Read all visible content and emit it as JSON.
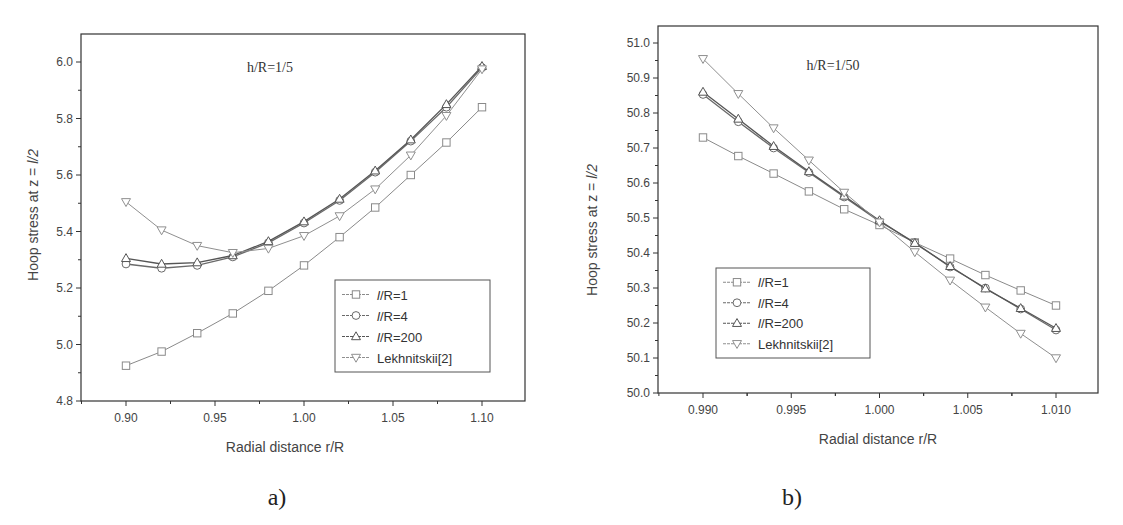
{
  "chart_data": [
    {
      "id": "a",
      "type": "line",
      "panel_label": "a)",
      "title": "",
      "annotation": "h/R=1/5",
      "xlabel": "Radial distance r/R",
      "ylabel": "Hoop stress at z = l/2",
      "xlim": [
        0.875,
        1.1225
      ],
      "ylim": [
        4.8,
        6.1
      ],
      "xticks": [
        "0.90",
        "0.95",
        "1.00",
        "1.05",
        "1.10"
      ],
      "yticks": [
        "4.8",
        "5.0",
        "5.2",
        "5.4",
        "5.6",
        "5.8",
        "6.0"
      ],
      "grid": false,
      "legend_position": "lower right",
      "x": [
        0.9,
        0.92,
        0.94,
        0.96,
        0.98,
        1.0,
        1.02,
        1.04,
        1.06,
        1.08,
        1.1
      ],
      "series": [
        {
          "name": "l/R=1",
          "marker": "square",
          "values": [
            4.925,
            4.975,
            5.04,
            5.11,
            5.19,
            5.28,
            5.38,
            5.485,
            5.6,
            5.715,
            5.84
          ]
        },
        {
          "name": "l/R=4",
          "marker": "circle",
          "values": [
            5.285,
            5.27,
            5.28,
            5.31,
            5.36,
            5.43,
            5.51,
            5.61,
            5.72,
            5.84,
            5.98
          ]
        },
        {
          "name": "l/R=200",
          "marker": "triangle-up",
          "values": [
            5.305,
            5.285,
            5.29,
            5.315,
            5.365,
            5.435,
            5.515,
            5.615,
            5.725,
            5.85,
            5.985
          ]
        },
        {
          "name": "Lekhnitskii[2]",
          "marker": "triangle-down",
          "values": [
            5.505,
            5.405,
            5.35,
            5.325,
            5.34,
            5.385,
            5.455,
            5.55,
            5.67,
            5.81,
            5.975
          ]
        }
      ]
    },
    {
      "id": "b",
      "type": "line",
      "panel_label": "b)",
      "title": "",
      "annotation": "h/R=1/50",
      "xlabel": "Radial distance r/R",
      "ylabel": "Hoop stress at z = l/2",
      "xlim": [
        0.9875,
        1.0124
      ],
      "ylim": [
        50.0,
        51.05
      ],
      "xticks": [
        "0.990",
        "0.995",
        "1.000",
        "1.005",
        "1.010"
      ],
      "yticks": [
        "50.0",
        "50.1",
        "50.2",
        "50.3",
        "50.4",
        "50.5",
        "50.6",
        "50.7",
        "50.8",
        "50.9",
        "51.0"
      ],
      "grid": false,
      "legend_position": "lower left",
      "x": [
        0.99,
        0.992,
        0.994,
        0.996,
        0.998,
        1.0,
        1.002,
        1.004,
        1.006,
        1.008,
        1.01
      ],
      "series": [
        {
          "name": "l/R=1",
          "marker": "square",
          "values": [
            50.73,
            50.677,
            50.627,
            50.576,
            50.525,
            50.48,
            50.43,
            50.384,
            50.337,
            50.293,
            50.25
          ]
        },
        {
          "name": "l/R=4",
          "marker": "circle",
          "values": [
            50.853,
            50.775,
            50.7,
            50.63,
            50.56,
            50.49,
            50.43,
            50.36,
            50.3,
            50.24,
            50.18
          ]
        },
        {
          "name": "l/R=200",
          "marker": "triangle-up",
          "values": [
            50.86,
            50.783,
            50.705,
            50.633,
            50.563,
            50.493,
            50.428,
            50.362,
            50.298,
            50.242,
            50.185
          ]
        },
        {
          "name": "Lekhnitskii[2]",
          "marker": "triangle-down",
          "values": [
            50.955,
            50.855,
            50.757,
            50.665,
            50.573,
            50.488,
            50.403,
            50.322,
            50.245,
            50.17,
            50.1
          ]
        }
      ]
    }
  ],
  "layout": {
    "a": {
      "plot": {
        "left": 81,
        "top": 34,
        "right": 525,
        "bottom": 401
      },
      "xref": [
        0.9,
        126,
        1.1,
        482
      ],
      "yref": [
        4.8,
        401,
        6.0,
        62
      ],
      "annotation_pos": [
        270,
        72
      ],
      "legend_box": [
        335,
        280,
        490,
        372
      ],
      "xlabel_pos": [
        285,
        452
      ],
      "ylabel_pos": [
        38,
        215
      ],
      "sublabel_pos": [
        277,
        505
      ]
    },
    "b": {
      "plot": {
        "left": 98,
        "top": 26,
        "right": 538,
        "bottom": 393
      },
      "xref": [
        0.99,
        143,
        1.01,
        496
      ],
      "yref": [
        50.0,
        393,
        51.0,
        43
      ],
      "annotation_pos": [
        273,
        70
      ],
      "legend_box": [
        156,
        268,
        310,
        358
      ],
      "xlabel_pos": [
        318,
        444
      ],
      "ylabel_pos": [
        37,
        230
      ],
      "sublabel_pos": [
        232,
        505
      ]
    }
  },
  "colors": {
    "axis": "#333333",
    "text": "#444444",
    "series": [
      "#8a8a8a",
      "#6a6a6a",
      "#555555",
      "#8f8f8f"
    ]
  }
}
